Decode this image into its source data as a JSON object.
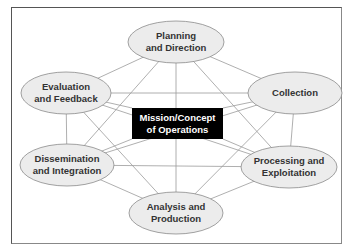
{
  "diagram": {
    "center": {
      "line1": "Mission/Concept",
      "line2": "of Operations"
    },
    "nodes": [
      {
        "id": "planning",
        "line1": "Planning",
        "line2": "and Direction"
      },
      {
        "id": "collection",
        "line1": "Collection",
        "line2": ""
      },
      {
        "id": "processing",
        "line1": "Processing and",
        "line2": "Exploitation"
      },
      {
        "id": "analysis",
        "line1": "Analysis and",
        "line2": "Production"
      },
      {
        "id": "dissemination",
        "line1": "Dissemination",
        "line2": "and Integration"
      },
      {
        "id": "evaluation",
        "line1": "Evaluation",
        "line2": "and Feedback"
      }
    ],
    "colors": {
      "ellipse_fill": "#ececec",
      "ellipse_stroke": "#8a8a8a",
      "line": "#9a9a9a",
      "center_fill": "#000000",
      "center_text": "#ffffff",
      "node_text": "#333333"
    }
  }
}
